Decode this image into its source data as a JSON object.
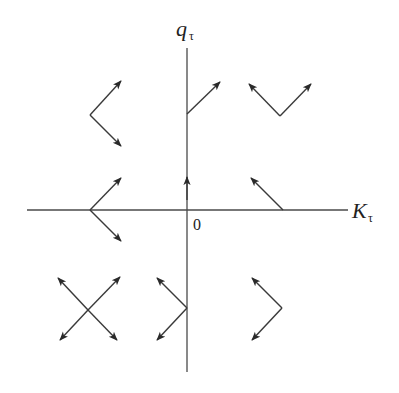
{
  "diagram": {
    "type": "phase-portrait",
    "axes": {
      "x_label": "K",
      "x_subscript": "τ",
      "y_label": "q",
      "y_subscript": "τ",
      "origin_label": "0"
    },
    "colors": {
      "axis": "#4a4a4a",
      "vector": "#3a3a3a",
      "text": "#222222"
    },
    "vector_groups": [
      {
        "region": "upper-left",
        "shape": "V opening right",
        "directions": [
          "up-right",
          "down-right"
        ]
      },
      {
        "region": "upper-center-on-axis",
        "shape": "single arrow",
        "directions": [
          "up-right"
        ]
      },
      {
        "region": "upper-right",
        "shape": "V opening up",
        "directions": [
          "up-left",
          "up-right"
        ]
      },
      {
        "region": "middle-left-on-axis",
        "shape": "V opening right",
        "directions": [
          "up-right",
          "down-right"
        ]
      },
      {
        "region": "center-on-vertical-axis",
        "shape": "single arrow",
        "directions": [
          "up"
        ]
      },
      {
        "region": "middle-right-on-axis",
        "shape": "single arrow",
        "directions": [
          "up-left"
        ]
      },
      {
        "region": "lower-left",
        "shape": "X",
        "directions": [
          "up-left",
          "up-right",
          "down-left",
          "down-right"
        ]
      },
      {
        "region": "lower-center-on-axis",
        "shape": "V opening left",
        "directions": [
          "up-left",
          "down-left"
        ]
      },
      {
        "region": "lower-right",
        "shape": "V opening left",
        "directions": [
          "up-left",
          "down-left"
        ]
      }
    ]
  }
}
